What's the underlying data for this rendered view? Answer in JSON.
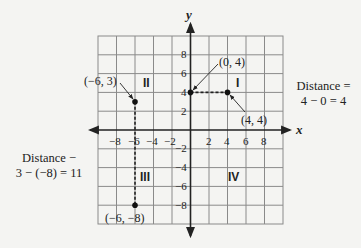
{
  "axes": {
    "x_label": "x",
    "y_label": "y",
    "x_ticks": [
      "−8",
      "−6",
      "−4",
      "−2",
      "2",
      "4",
      "6",
      "8"
    ],
    "y_ticks": [
      "8",
      "6",
      "4",
      "2",
      "−2",
      "−4",
      "−6",
      "−8"
    ]
  },
  "quadrants": {
    "q1": "I",
    "q2": "II",
    "q3": "III",
    "q4": "IV"
  },
  "points": {
    "p1": "(0, 4)",
    "p2": "(4, 4)",
    "p3": "(−6, 3)",
    "p4": "(−6, −8)"
  },
  "annotations": {
    "right_line1": "Distance =",
    "right_line2": "4 − 0 = 4",
    "left_line1": "Distance −",
    "left_line2": "3 − (−8) = 11"
  },
  "colors": {
    "grid": "#8a8a8a",
    "axis": "#222222",
    "background": "#f4f4f2"
  }
}
